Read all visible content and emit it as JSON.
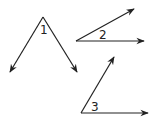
{
  "diagram": {
    "type": "angles",
    "stroke_color": "#222222",
    "background": "#ffffff",
    "angles": [
      {
        "label": "1",
        "vertex": [
          43,
          17
        ],
        "rays": [
          [
            10,
            72
          ],
          [
            77,
            72
          ]
        ],
        "label_pos": [
          40,
          34
        ]
      },
      {
        "label": "2",
        "vertex": [
          76,
          41
        ],
        "rays": [
          [
            134,
            9
          ],
          [
            144,
            41
          ]
        ],
        "label_pos": [
          99,
          39
        ]
      },
      {
        "label": "3",
        "vertex": [
          81,
          113
        ],
        "rays": [
          [
            114,
            57
          ],
          [
            148,
            113
          ]
        ],
        "label_pos": [
          91,
          111
        ]
      }
    ]
  }
}
